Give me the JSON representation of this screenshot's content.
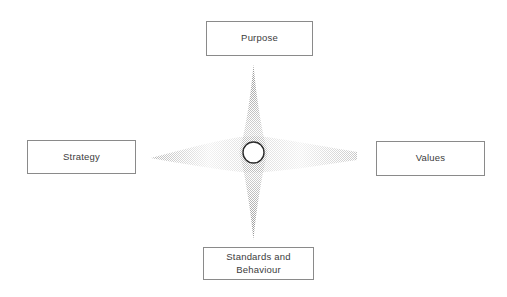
{
  "diagram": {
    "background_color": "#ffffff",
    "width": 507,
    "height": 297,
    "center_node": {
      "shape": "circle",
      "fill_color": "#ffffff",
      "stroke_color": "#2b2b2b",
      "label": ""
    },
    "connector": {
      "shape": "four-pointed-star",
      "style": "halftone-gradient",
      "color": "#9a9a9a"
    },
    "nodes": [
      {
        "id": "purpose",
        "label": "Purpose",
        "position": "top"
      },
      {
        "id": "strategy",
        "label": "Strategy",
        "position": "left"
      },
      {
        "id": "values",
        "label": "Values",
        "position": "right"
      },
      {
        "id": "standards",
        "label": "Standards and\nBehaviour",
        "position": "bottom"
      }
    ],
    "colors": {
      "box_border": "#8a8a8a",
      "box_fill": "#ffffff",
      "text": "#3c3c3c",
      "star": "#9a9a9a",
      "circle_stroke": "#2b2b2b"
    }
  }
}
